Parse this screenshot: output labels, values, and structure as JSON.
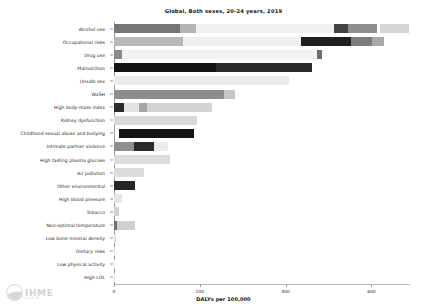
{
  "chart_data": {
    "type": "bar",
    "orientation": "horizontal",
    "stacked": true,
    "title": "Global, Both sexes, 20-24 years, 2019",
    "xlabel": "DALYs per 100,000",
    "ylabel": "",
    "xlim": [
      0,
      690
    ],
    "xticks": [
      0,
      200,
      400,
      600
    ],
    "xticklabels": [
      "0",
      "200",
      "400",
      "600"
    ],
    "grid": false,
    "legend": "none",
    "categories": [
      "Alcohol use",
      "Occupational risks",
      "Drug use",
      "Malnutrition",
      "Unsafe sex",
      "WaSH",
      "High body-mass index",
      "Kidney dysfunction",
      "Childhood sexual abuse and bullying",
      "Intimate partner violence",
      "High fasting plasma glucose",
      "Air pollution",
      "Other environmental",
      "High blood pressure",
      "Tobacco",
      "Non-optimal temperature",
      "Low bone mineral density",
      "Dietary risks",
      "Low physical activity",
      "High LDL"
    ],
    "totals": [
      688,
      630,
      486,
      462,
      409,
      283,
      228,
      193,
      186,
      126,
      130,
      70,
      49,
      19,
      12,
      50,
      4,
      2,
      1,
      1
    ],
    "bars": [
      {
        "category": "Alcohol use",
        "total": 688,
        "segments": [
          {
            "start": 0,
            "end": 153,
            "color": "#767676"
          },
          {
            "start": 153,
            "end": 191,
            "color": "#b4b4b4"
          },
          {
            "start": 191,
            "end": 514,
            "color": "#f1f1f1"
          },
          {
            "start": 514,
            "end": 546,
            "color": "#434343"
          },
          {
            "start": 546,
            "end": 614,
            "color": "#8e8e8e"
          },
          {
            "start": 621,
            "end": 688,
            "color": "#d6d6d6"
          }
        ]
      },
      {
        "category": "Occupational risks",
        "total": 630,
        "segments": [
          {
            "start": 0,
            "end": 160,
            "color": "#b9b9b9"
          },
          {
            "start": 160,
            "end": 437,
            "color": "#efefef"
          },
          {
            "start": 437,
            "end": 553,
            "color": "#1f1f1f"
          },
          {
            "start": 553,
            "end": 602,
            "color": "#7d7d7d"
          },
          {
            "start": 602,
            "end": 630,
            "color": "#a9a9a9"
          }
        ]
      },
      {
        "category": "Drug use",
        "total": 486,
        "segments": [
          {
            "start": 0,
            "end": 19,
            "color": "#8a8a8a"
          },
          {
            "start": 19,
            "end": 474,
            "color": "#f2f2f2"
          },
          {
            "start": 474,
            "end": 486,
            "color": "#6e6e6e"
          }
        ]
      },
      {
        "category": "Malnutrition",
        "total": 462,
        "segments": [
          {
            "start": 0,
            "end": 237,
            "color": "#141414"
          },
          {
            "start": 237,
            "end": 462,
            "color": "#2b2b2b"
          }
        ]
      },
      {
        "category": "Unsafe sex",
        "total": 409,
        "segments": [
          {
            "start": 0,
            "end": 409,
            "color": "#ebebeb"
          }
        ]
      },
      {
        "category": "WaSH",
        "total": 283,
        "segments": [
          {
            "start": 0,
            "end": 256,
            "color": "#8d8d8d"
          },
          {
            "start": 256,
            "end": 283,
            "color": "#c6c6c6"
          }
        ]
      },
      {
        "category": "High body-mass index",
        "total": 228,
        "segments": [
          {
            "start": 0,
            "end": 23,
            "color": "#2a2a2a"
          },
          {
            "start": 23,
            "end": 58,
            "color": "#e2e2e2"
          },
          {
            "start": 58,
            "end": 77,
            "color": "#a6a6a6"
          },
          {
            "start": 77,
            "end": 228,
            "color": "#d3d3d3"
          }
        ]
      },
      {
        "category": "Kidney dysfunction",
        "total": 193,
        "segments": [
          {
            "start": 0,
            "end": 193,
            "color": "#d9d9d9"
          }
        ]
      },
      {
        "category": "Childhood sexual abuse and bullying",
        "total": 186,
        "segments": [
          {
            "start": 12,
            "end": 186,
            "color": "#141414"
          }
        ]
      },
      {
        "category": "Intimate partner violence",
        "total": 126,
        "segments": [
          {
            "start": 0,
            "end": 47,
            "color": "#8f8f8f"
          },
          {
            "start": 47,
            "end": 93,
            "color": "#2b2b2b"
          },
          {
            "start": 93,
            "end": 126,
            "color": "#ececec"
          }
        ]
      },
      {
        "category": "High fasting plasma glucose",
        "total": 130,
        "segments": [
          {
            "start": 0,
            "end": 130,
            "color": "#dcdcdc"
          }
        ]
      },
      {
        "category": "Air pollution",
        "total": 70,
        "segments": [
          {
            "start": 0,
            "end": 70,
            "color": "#dddddd"
          }
        ]
      },
      {
        "category": "Other environmental",
        "total": 49,
        "segments": [
          {
            "start": 0,
            "end": 49,
            "color": "#262626"
          }
        ]
      },
      {
        "category": "High blood pressure",
        "total": 19,
        "segments": [
          {
            "start": 0,
            "end": 19,
            "color": "#e6e6e6"
          }
        ]
      },
      {
        "category": "Tobacco",
        "total": 12,
        "segments": [
          {
            "start": 0,
            "end": 12,
            "color": "#d2d2d2"
          }
        ]
      },
      {
        "category": "Non-optimal temperature",
        "total": 50,
        "segments": [
          {
            "start": 0,
            "end": 7,
            "color": "#6f6f6f"
          },
          {
            "start": 7,
            "end": 50,
            "color": "#cfcfcf"
          }
        ]
      },
      {
        "category": "Low bone mineral density",
        "total": 4,
        "segments": [
          {
            "start": 0,
            "end": 4,
            "color": "#e0e0e0"
          }
        ]
      },
      {
        "category": "Dietary risks",
        "total": 2,
        "segments": [
          {
            "start": 0,
            "end": 2,
            "color": "#e4e4e4"
          }
        ]
      },
      {
        "category": "Low physical activity",
        "total": 1,
        "segments": [
          {
            "start": 0,
            "end": 1,
            "color": "#e8e8e8"
          }
        ]
      },
      {
        "category": "High LDL",
        "total": 1,
        "segments": [
          {
            "start": 0,
            "end": 1,
            "color": "#e8e8e8"
          }
        ]
      }
    ]
  },
  "watermark": {
    "text": "IHME",
    "sub": "28 of 20",
    "logo": "ihme-globe-icon"
  }
}
